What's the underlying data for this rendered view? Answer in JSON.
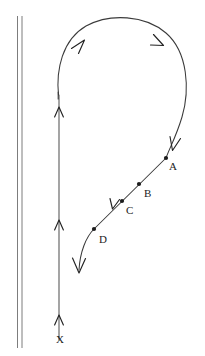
{
  "figure": {
    "background_color": "#ffffff",
    "ink_color": "#232323",
    "width": 205,
    "height": 356
  },
  "wall": {
    "name": "wall-boundary",
    "description": "two thin parallel vertical lines at left edge",
    "line_color": "#6e6e6e",
    "x_left": 17,
    "x_right": 22,
    "y_top": 16,
    "y_bottom": 348
  },
  "axis": {
    "name": "vertical-axis-line",
    "line_color": "#5a5a5a",
    "x": 59,
    "y_top": 95,
    "y_bottom": 340,
    "arrow_direction": "up",
    "arrow_positions_y": [
      110,
      223,
      318
    ],
    "end_label": "X",
    "end_label_x": 56,
    "end_label_y": 334
  },
  "curve": {
    "name": "streamline-curve",
    "line_color": "#3a3a3a",
    "description": "loop rising from the vertical line, arcing clockwise over the top and descending diagonally down-left past the labelled points",
    "arrow_direction": "clockwise",
    "arrow_positions": [
      {
        "x": 83,
        "y": 45,
        "angle": -48
      },
      {
        "x": 160,
        "y": 42,
        "angle": 52
      },
      {
        "x": 175,
        "y": 147,
        "angle": 112
      },
      {
        "x": 114,
        "y": 207,
        "angle": 132
      },
      {
        "x": 79,
        "y": 270,
        "angle": 100
      }
    ],
    "end_arrow": {
      "x": 79,
      "y": 272,
      "direction": "down-left"
    }
  },
  "points": [
    {
      "id": "A",
      "label": "A",
      "dot_x": 166,
      "dot_y": 158,
      "label_x": 169,
      "label_y": 161
    },
    {
      "id": "B",
      "label": "B",
      "dot_x": 139,
      "dot_y": 184,
      "label_x": 144,
      "label_y": 188
    },
    {
      "id": "C",
      "label": "C",
      "dot_x": 122,
      "dot_y": 201,
      "label_x": 126,
      "label_y": 205
    },
    {
      "id": "D",
      "label": "D",
      "dot_x": 94,
      "dot_y": 229,
      "label_x": 99,
      "label_y": 234
    }
  ]
}
